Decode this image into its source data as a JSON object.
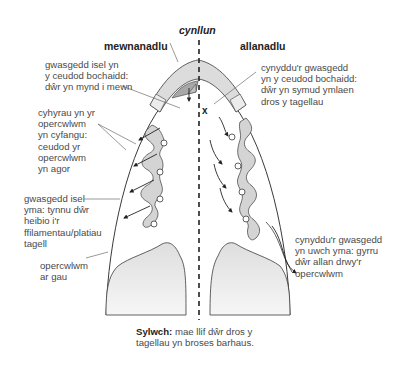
{
  "diagram": {
    "center_label": "cynllun",
    "left_title": "mewnanadlu",
    "right_title": "allanadlu",
    "left_labels": [
      [
        "gwasgedd isel yn",
        "y ceudod bochaidd:",
        "dŵr yn mynd i mewn"
      ],
      [
        "cyhyrau yn yr",
        "opercwlwm",
        "yn cyfangu:",
        "ceudod yr",
        "opercwlwm",
        "yn agor"
      ],
      [
        "gwasgedd isel",
        "yma: tynnu dŵr",
        "heibio i'r",
        "ffilamentau/platiau",
        "tagell"
      ],
      [
        "opercwlwm",
        "ar gau"
      ]
    ],
    "right_labels": [
      [
        "cynyddu'r gwasgedd",
        "yn y ceudod bochaidd:",
        "dŵr yn symud ymlaen",
        "dros y tagellau"
      ],
      [
        "cynyddu'r gwasgedd",
        "yn uwch yma: gyrru",
        "dŵr allan drwy'r",
        "opercwlwm"
      ]
    ],
    "marker": "x",
    "note_bold": "Sylwch:",
    "note_line1": " mae llif dŵr dros y",
    "note_line2": "tagellau yn broses barhaus."
  },
  "colors": {
    "outline": "#3a3a3a",
    "fill_light": "#e2e2e2",
    "fill_mid": "#c8c8c8",
    "fill_dark": "#a8a8a8",
    "text": "#4a4a4a"
  }
}
